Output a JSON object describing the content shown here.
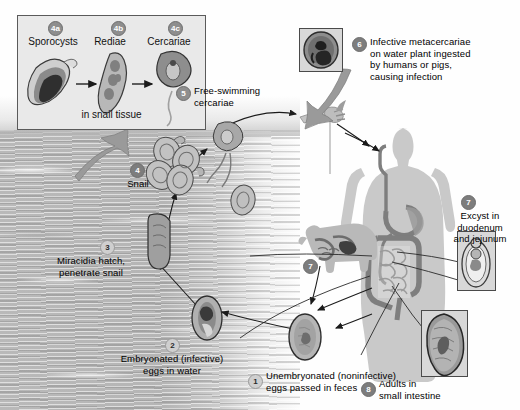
{
  "diagram": {
    "inset": {
      "name": "in-snail-tissue-panel",
      "footer_label": "in snail tissue",
      "stages": [
        {
          "badge": "4a",
          "label": "Sporocysts",
          "icon": "sporocyst-micrograph"
        },
        {
          "badge": "4b",
          "label": "Rediae",
          "icon": "redia-micrograph"
        },
        {
          "badge": "4c",
          "label": "Cercariae",
          "icon": "cercaria-micrograph"
        }
      ],
      "arrow_icons": [
        "arrow-right-icon",
        "arrow-right-icon"
      ]
    },
    "stages": [
      {
        "badge": "1",
        "label": "Unembryonated (noninfective)\neggs passed in feces",
        "line1": "Unembryonated (noninfective)",
        "line2": "eggs passed in feces",
        "icon": "unembryonated-egg"
      },
      {
        "badge": "2",
        "line1": "Embryonated (infective)",
        "line2": "eggs in water",
        "icon": "embryonated-egg"
      },
      {
        "badge": "3",
        "line1": "Miracidia hatch,",
        "line2": "penetrate snail",
        "icon": "miracidium"
      },
      {
        "badge": "4",
        "line1": "Snail",
        "line2": "",
        "icon": "snail-cluster"
      },
      {
        "badge": "5",
        "line1": "Free-swimming",
        "line2": "cercariae",
        "icon": "free-swimming-cercaria"
      },
      {
        "badge": "6",
        "line1": "Infective metacercariae",
        "line2": "on water plant ingested",
        "line3": "by humans or pigs,",
        "line4": "causing infection",
        "icon": "metacercaria-micrograph"
      },
      {
        "badge": "7",
        "line1": "Excyst in",
        "line2": "duodenum",
        "line3": "and jejunum",
        "icon": "excysted-metacercaria-micrograph"
      },
      {
        "badge": "8",
        "line1": "Adults in",
        "line2": "small intestine",
        "icon": "adult-fluke-micrograph"
      }
    ],
    "markers": {
      "pig_stage_badge": "7",
      "human_stage_badge": "7"
    },
    "figures": {
      "human": "human-silhouette-with-digestive-tract",
      "pig": "pig-silhouette-with-digestive-tract",
      "fork": "fork-with-water-plant",
      "big_arrow": "large-curved-arrow-to-snail-tissue-panel",
      "ingest_arrow": "large-curved-arrow-metacercariae-to-fork"
    },
    "colors": {
      "water": "#b8b8b8",
      "panel_bg": "#ececec",
      "badge": "#8e8e8e",
      "stroke": "#1b1b1b",
      "silhouette": "#c9c9c9",
      "tract": "#8a8a8a"
    }
  }
}
